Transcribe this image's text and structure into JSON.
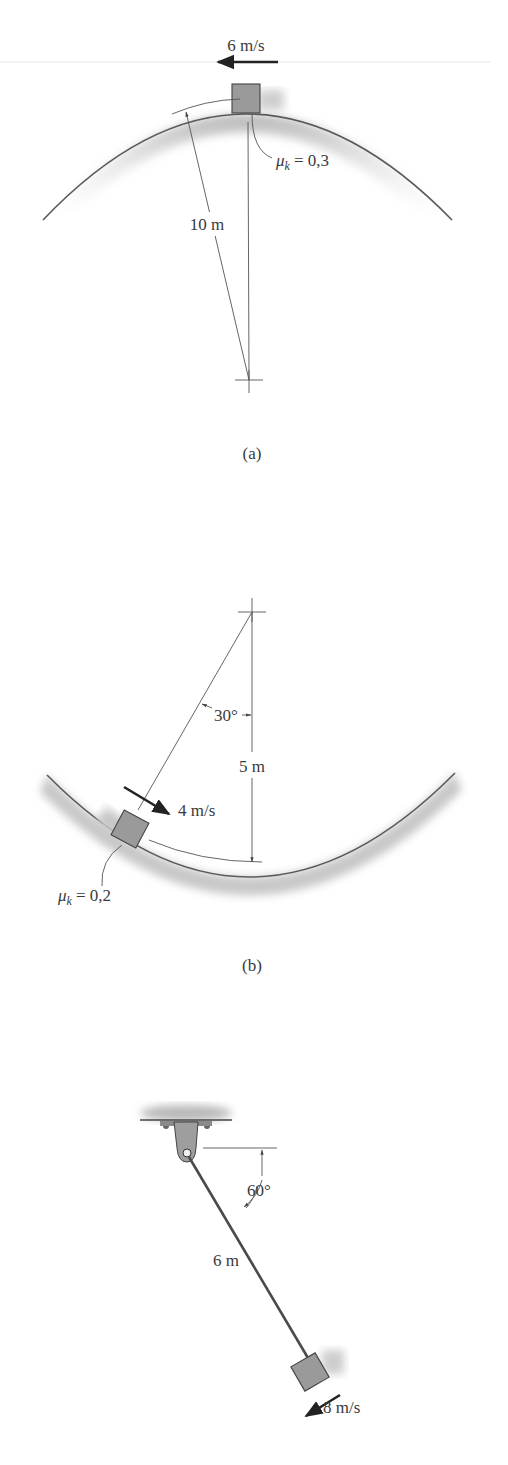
{
  "figure": {
    "panels": [
      {
        "id": "a",
        "caption": "(a)",
        "velocity_label": "6 m/s",
        "radius_label": "10 m",
        "friction": {
          "symbol": "μ",
          "subscript": "k",
          "value": "= 0,3"
        }
      },
      {
        "id": "b",
        "caption": "(b)",
        "velocity_label": "4 m/s",
        "radius_label": "5 m",
        "angle_label": "30°",
        "friction": {
          "symbol": "μ",
          "subscript": "k",
          "value": "= 0,2"
        }
      },
      {
        "id": "c",
        "caption": "",
        "velocity_label": "8 m/s",
        "length_label": "6 m",
        "angle_label": "60°"
      }
    ]
  },
  "colors": {
    "background": "#ffffff",
    "block": "#9a9a9a",
    "surface_shade": "#bdbdbd",
    "line": "#555555"
  }
}
